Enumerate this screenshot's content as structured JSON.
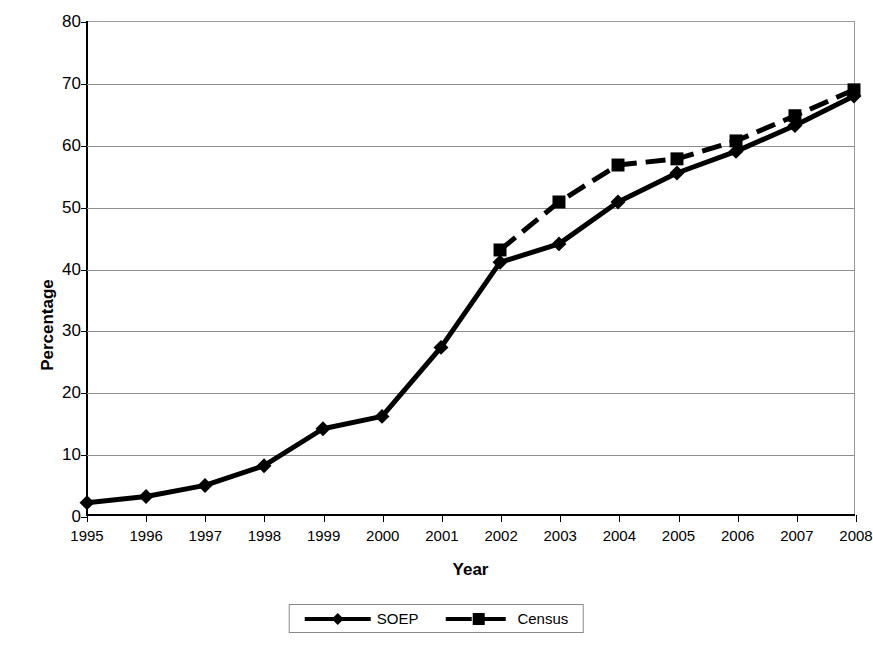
{
  "chart_data": {
    "type": "line",
    "title": "",
    "xlabel": "Year",
    "ylabel": "Percentage",
    "categories": [
      "1995",
      "1996",
      "1997",
      "1998",
      "1999",
      "2000",
      "2001",
      "2002",
      "2003",
      "2004",
      "2005",
      "2006",
      "2007",
      "2008"
    ],
    "x": [
      1995,
      1996,
      1997,
      1998,
      1999,
      2000,
      2001,
      2002,
      2003,
      2004,
      2005,
      2006,
      2007,
      2008
    ],
    "xlim": [
      1995,
      2008
    ],
    "ylim": [
      0,
      80
    ],
    "y_ticks": [
      0,
      10,
      20,
      30,
      40,
      50,
      60,
      70,
      80
    ],
    "x_ticks": [
      "1995",
      "1996",
      "1997",
      "1998",
      "1999",
      "2000",
      "2001",
      "2002",
      "2003",
      "2004",
      "2005",
      "2006",
      "2007",
      "2008"
    ],
    "grid": true,
    "legend_position": "bottom",
    "series": [
      {
        "name": "SOEP",
        "marker": "diamond",
        "line_style": "solid",
        "color": "#000000",
        "values": [
          2,
          3,
          4.8,
          8,
          14,
          16,
          27.2,
          41,
          44,
          50.8,
          55.5,
          59,
          63.2,
          68
        ]
      },
      {
        "name": "Census",
        "marker": "square",
        "line_style": "dashed",
        "color": "#000000",
        "values": [
          null,
          null,
          null,
          null,
          null,
          null,
          null,
          43,
          50.8,
          56.8,
          57.8,
          60.7,
          64.8,
          69
        ]
      }
    ]
  },
  "axis": {
    "y_title": "Percentage",
    "x_title": "Year",
    "y_tick_labels": [
      "0",
      "10",
      "20",
      "30",
      "40",
      "50",
      "60",
      "70",
      "80"
    ],
    "x_tick_labels": [
      "1995",
      "1996",
      "1997",
      "1998",
      "1999",
      "2000",
      "2001",
      "2002",
      "2003",
      "2004",
      "2005",
      "2006",
      "2007",
      "2008"
    ]
  },
  "legend": {
    "items": [
      {
        "label": "SOEP",
        "marker": "diamond-marker-icon",
        "line": "solid"
      },
      {
        "label": "Census",
        "marker": "square-marker-icon",
        "line": "dashed"
      }
    ]
  },
  "colors": {
    "series": "#000000",
    "grid": "#8f8f8f",
    "axis": "#000000",
    "plot_background": "#ffffff",
    "page_background": "#ffffff"
  }
}
